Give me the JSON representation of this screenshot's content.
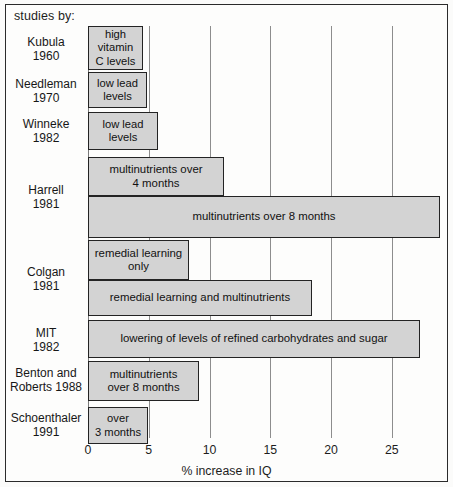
{
  "header": {
    "studies_by_label": "studies by:"
  },
  "axis": {
    "title": "% increase in IQ",
    "ticks": [
      0,
      5,
      10,
      15,
      20,
      25
    ],
    "tick_labels": [
      "0",
      "5",
      "10",
      "15",
      "20",
      "25"
    ],
    "min": 0,
    "max": 25.1
  },
  "colors": {
    "bar_fill": "#d3d3d3",
    "bar_border": "#232323",
    "gridline": "#8d8d8d",
    "frame": "#2b2b2b",
    "text": "#1d1d1d",
    "background": "#fdfdfc"
  },
  "chart_data": {
    "type": "bar",
    "orientation": "horizontal",
    "title": "",
    "subtitle": "",
    "xlabel": "% increase in IQ",
    "ylabel": "studies by:",
    "xlim": [
      0,
      25.1
    ],
    "grid": true,
    "legend": "none",
    "categories": [
      "Kubula\n1960",
      "Needleman\n1970",
      "Winneke\n1982",
      "Harrell\n1981",
      "Colgan\n1981",
      "MIT\n1982",
      "Benton and\nRoberts 1988",
      "Schoenthaler\n1991"
    ],
    "bars": [
      {
        "study": "Kubula 1960",
        "label": "high\nvitamin\nC levels",
        "value": 4.6
      },
      {
        "study": "Needleman 1970",
        "label": "low lead\nlevels",
        "value": 4.9
      },
      {
        "study": "Winneke 1982",
        "label": "low lead\nlevels",
        "value": 5.8
      },
      {
        "study": "Harrell 1981",
        "label": "multinutrients over\n4 months",
        "value": 11.2
      },
      {
        "study": "Harrell 1981",
        "label": "multinutrients over 8 months",
        "value": 28.9
      },
      {
        "study": "Colgan 1981",
        "label": "remedial learning\nonly",
        "value": 8.3
      },
      {
        "study": "Colgan 1981",
        "label": "remedial learning and multinutrients",
        "value": 18.4
      },
      {
        "study": "MIT 1982",
        "label": "lowering of levels of refined carbohydrates and sugar",
        "value": 27.3
      },
      {
        "study": "Benton and Roberts 1988",
        "label": "multinutrients\nover 8 months",
        "value": 9.1
      },
      {
        "study": "Schoenthaler 1991",
        "label": "over\n3 months",
        "value": 4.9
      }
    ]
  },
  "bar_geometry": [
    {
      "name": "bar-kubula",
      "top": 26,
      "height": 44,
      "width_px": 55,
      "bind": "chart_data.bars.0.label"
    },
    {
      "name": "bar-needleman",
      "top": 72,
      "height": 36,
      "width_px": 59,
      "bind": "chart_data.bars.1.label"
    },
    {
      "name": "bar-winneke",
      "top": 112,
      "height": 38,
      "width_px": 70,
      "bind": "chart_data.bars.2.label"
    },
    {
      "name": "bar-harrell-4mo",
      "top": 157,
      "height": 39,
      "width_px": 136,
      "bind": "chart_data.bars.3.label"
    },
    {
      "name": "bar-harrell-8mo",
      "top": 196,
      "height": 42,
      "width_px": 352,
      "bind": "chart_data.bars.4.label"
    },
    {
      "name": "bar-colgan-remedial",
      "top": 240,
      "height": 40,
      "width_px": 101,
      "bind": "chart_data.bars.5.label"
    },
    {
      "name": "bar-colgan-combo",
      "top": 280,
      "height": 36,
      "width_px": 224,
      "bind": "chart_data.bars.6.label"
    },
    {
      "name": "bar-mit",
      "top": 320,
      "height": 38,
      "width_px": 332,
      "bind": "chart_data.bars.7.label"
    },
    {
      "name": "bar-benton",
      "top": 361,
      "height": 40,
      "width_px": 111,
      "bind": "chart_data.bars.8.label"
    },
    {
      "name": "bar-schoenthaler",
      "top": 407,
      "height": 37,
      "width_px": 60,
      "bind": "chart_data.bars.9.label"
    }
  ],
  "category_geometry": [
    {
      "name": "cat-label-kubula",
      "top": 35,
      "bind": "chart_data.categories.0"
    },
    {
      "name": "cat-label-needleman",
      "top": 77,
      "bind": "chart_data.categories.1"
    },
    {
      "name": "cat-label-winneke",
      "top": 117,
      "bind": "chart_data.categories.2"
    },
    {
      "name": "cat-label-harrell",
      "top": 183,
      "bind": "chart_data.categories.3"
    },
    {
      "name": "cat-label-colgan",
      "top": 265,
      "bind": "chart_data.categories.4"
    },
    {
      "name": "cat-label-mit",
      "top": 326,
      "bind": "chart_data.categories.5"
    },
    {
      "name": "cat-label-benton",
      "top": 366,
      "bind": "chart_data.categories.6"
    },
    {
      "name": "cat-label-schoenthaler",
      "top": 411,
      "bind": "chart_data.categories.7"
    }
  ]
}
